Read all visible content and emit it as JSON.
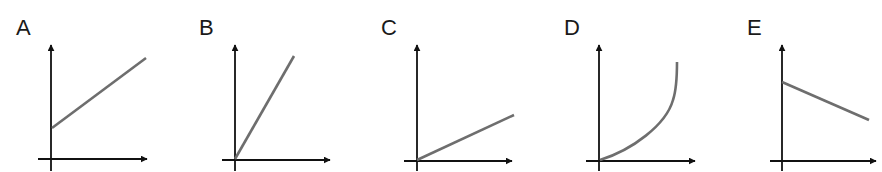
{
  "figure": {
    "axis_color": "#111111",
    "curve_color": "#6e6e6e"
  },
  "panels": [
    {
      "label": "A",
      "shape": "linear, positive slope, positive y-intercept"
    },
    {
      "label": "B",
      "shape": "linear through origin, steep positive slope"
    },
    {
      "label": "C",
      "shape": "linear through origin, shallow positive slope"
    },
    {
      "label": "D",
      "shape": "curve through origin, increasing and concave up"
    },
    {
      "label": "E",
      "shape": "linear, negative slope, positive y-intercept"
    }
  ]
}
